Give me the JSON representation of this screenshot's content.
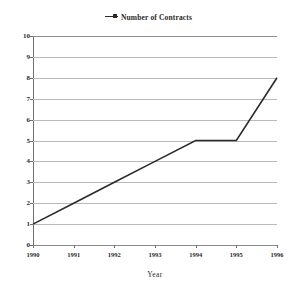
{
  "legend": {
    "entries": [
      {
        "label": "Number of Contracts",
        "color": "#2b2b2b",
        "marker": "line-marker-icon"
      }
    ]
  },
  "axes": {
    "x_title": "Year",
    "y_title": ""
  },
  "chart_data": {
    "type": "line",
    "title": "",
    "subtitle": "",
    "xlabel": "Year",
    "ylabel": "",
    "categories": [
      "1990",
      "1991",
      "1992",
      "1993",
      "1994",
      "1995",
      "1996"
    ],
    "x": [
      1990,
      1991,
      1992,
      1993,
      1994,
      1995,
      1996
    ],
    "series": [
      {
        "name": "Number of Contracts",
        "color": "#2b2b2b",
        "values": [
          1,
          2,
          3,
          4,
          5,
          5,
          8
        ]
      }
    ],
    "ylim": [
      0,
      10
    ],
    "yticks": [
      0,
      1,
      2,
      3,
      4,
      5,
      6,
      7,
      8,
      9,
      10
    ],
    "ytick_labels": [
      "0",
      "1",
      "2",
      "3",
      "4",
      "5",
      "6",
      "7",
      "8",
      "9",
      "10"
    ],
    "xtick_labels": [
      "1990",
      "1991",
      "1992",
      "1993",
      "1994",
      "1995",
      "1996"
    ],
    "grid": true,
    "grid_axis": "y",
    "legend_position": "top-center",
    "markers": false,
    "line_width": 1.6,
    "background": "#ffffff",
    "grid_color": "#b9b9b9",
    "axis_color": "#6f6f6f"
  }
}
